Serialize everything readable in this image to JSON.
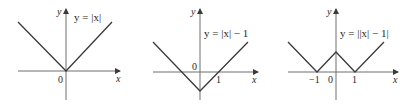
{
  "figure": {
    "panels": [
      {
        "id": "graph-abs-x",
        "equation": "y = |x|",
        "axis_labels": {
          "x": "x",
          "y": "y"
        },
        "tick_labels": {
          "origin": "0"
        }
      },
      {
        "id": "graph-abs-x-minus-1",
        "equation": "y = |x| − 1",
        "axis_labels": {
          "x": "x",
          "y": "y"
        },
        "tick_labels": {
          "origin": "0",
          "one": "1"
        }
      },
      {
        "id": "graph-abs-abs-x-minus-1",
        "equation": "y = ||x| − 1|",
        "axis_labels": {
          "x": "x",
          "y": "y"
        },
        "tick_labels": {
          "neg_one": "−1",
          "origin": "0",
          "one": "1"
        }
      }
    ]
  }
}
